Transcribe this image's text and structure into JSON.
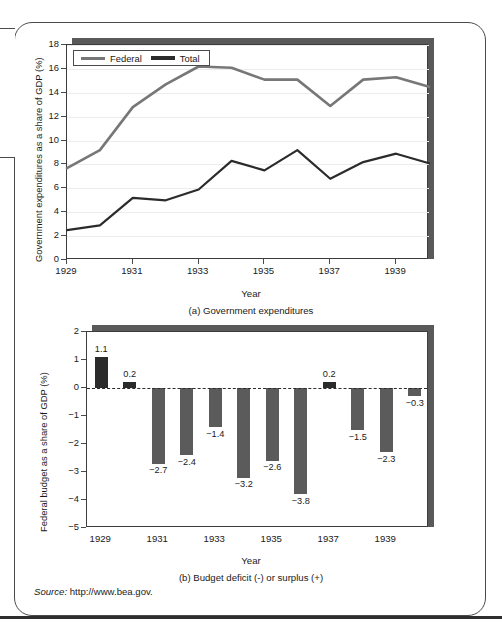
{
  "figure": {
    "source_label": "Source:",
    "source_url": "http://www.bea.gov."
  },
  "chart_data": [
    {
      "type": "line",
      "panel_caption": "(a) Government expenditures",
      "title": "",
      "xlabel": "Year",
      "ylabel": "Government expenditures as a share of GDP (%)",
      "xlim": [
        1929,
        1940
      ],
      "ylim": [
        0,
        18
      ],
      "yticks": [
        0,
        2,
        4,
        6,
        8,
        10,
        12,
        14,
        16,
        18
      ],
      "xticks": [
        1929,
        1931,
        1933,
        1935,
        1937,
        1939
      ],
      "grid": true,
      "legend_position": "top-left",
      "x": [
        1929,
        1930,
        1931,
        1932,
        1933,
        1934,
        1935,
        1936,
        1937,
        1938,
        1939,
        1940
      ],
      "series": [
        {
          "name": "Federal",
          "color": "#2b2b2b",
          "values": [
            2.5,
            2.9,
            5.2,
            5.0,
            5.9,
            8.3,
            7.5,
            9.2,
            6.8,
            8.2,
            8.9,
            8.1
          ]
        },
        {
          "name": "Total",
          "color": "#777777",
          "values": [
            7.7,
            9.2,
            12.8,
            14.7,
            16.2,
            16.1,
            15.1,
            15.1,
            12.9,
            15.1,
            15.3,
            14.5
          ]
        }
      ]
    },
    {
      "type": "bar",
      "panel_caption": "(b) Budget deficit (-) or surplus (+)",
      "title": "",
      "xlabel": "Year",
      "ylabel": "Federal budget as a share of GDP (%)",
      "ylim": [
        -5,
        2
      ],
      "yticks": [
        2,
        1,
        0,
        -1,
        -2,
        -3,
        -4,
        -5
      ],
      "xticks": [
        1929,
        1931,
        1933,
        1935,
        1937,
        1939
      ],
      "grid": false,
      "zero_line": true,
      "categories": [
        1929,
        1930,
        1931,
        1932,
        1933,
        1934,
        1935,
        1936,
        1937,
        1938,
        1939,
        1940
      ],
      "values": [
        1.1,
        0.2,
        -2.7,
        -2.4,
        -1.4,
        -3.2,
        -2.6,
        -3.8,
        0.2,
        -1.5,
        -2.3,
        -0.3
      ],
      "value_labels": [
        "1.1",
        "0.2",
        "−2.7",
        "−2.4",
        "−1.4",
        "−3.2",
        "−2.6",
        "−3.8",
        "0.2",
        "−1.5",
        "−2.3",
        "−0.3"
      ],
      "bar_color_negative": "#5b5b5b",
      "bar_color_positive": "#2b2b2b"
    }
  ]
}
